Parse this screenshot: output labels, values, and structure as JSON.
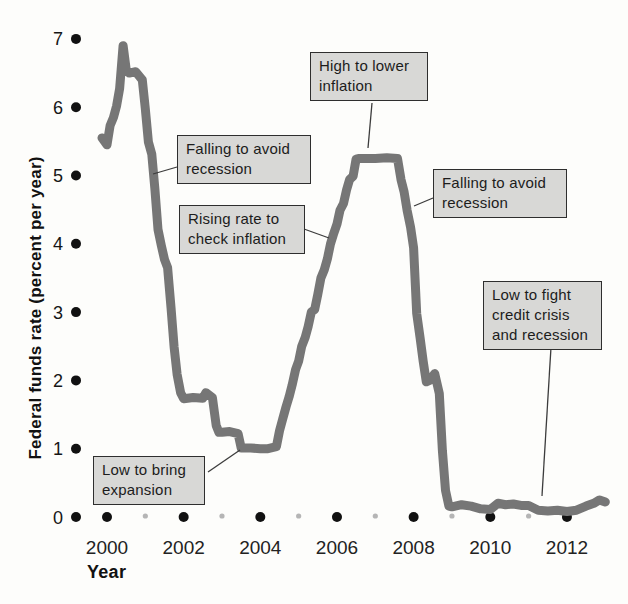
{
  "figure": {
    "y_axis_title": "Federal funds rate (percent per year)",
    "x_axis_title": "Year"
  },
  "annotations": [
    {
      "id": "falling-2001",
      "text": "Falling to avoid recession",
      "lines": [
        "Falling to avoid",
        "recession"
      ],
      "points_to": {
        "year": 2001.2,
        "rate": 5.0
      }
    },
    {
      "id": "rising-2004",
      "text": "Rising rate to check inflation",
      "lines": [
        "Rising rate to",
        "check inflation"
      ],
      "points_to": {
        "year": 2005.8,
        "rate": 4.1
      }
    },
    {
      "id": "high-2006",
      "text": "High to lower inflation",
      "lines": [
        "High to lower",
        "inflation"
      ],
      "points_to": {
        "year": 2006.8,
        "rate": 5.25
      }
    },
    {
      "id": "falling-2008",
      "text": "Falling to avoid recession",
      "lines": [
        "Falling to avoid",
        "recession"
      ],
      "points_to": {
        "year": 2008.0,
        "rate": 4.5
      }
    },
    {
      "id": "low-credit",
      "text": "Low to fight credit crisis and recession",
      "lines": [
        "Low to fight",
        "credit crisis",
        "and recession"
      ],
      "points_to": {
        "year": 2011.3,
        "rate": 0.2
      }
    },
    {
      "id": "low-expansion",
      "text": "Low to bring expansion",
      "lines": [
        "Low to bring",
        "expansion"
      ],
      "points_to": {
        "year": 2003.5,
        "rate": 1.0
      }
    }
  ],
  "chart_data": {
    "type": "line",
    "title": "",
    "xlabel": "Year",
    "ylabel": "Federal funds rate (percent per year)",
    "xlim": [
      1999.2,
      2013.2
    ],
    "ylim": [
      0,
      7
    ],
    "x_ticks_major": [
      2000,
      2002,
      2004,
      2006,
      2008,
      2010,
      2012
    ],
    "x_ticks_minor": [
      2001,
      2003,
      2005,
      2007,
      2009,
      2011
    ],
    "y_ticks": [
      0,
      1,
      2,
      3,
      4,
      5,
      6,
      7
    ],
    "grid": false,
    "legend": "none",
    "series": [
      {
        "name": "Federal funds rate",
        "points": [
          [
            1999.87,
            5.55
          ],
          [
            2000.0,
            5.45
          ],
          [
            2000.08,
            5.73
          ],
          [
            2000.17,
            5.85
          ],
          [
            2000.25,
            6.02
          ],
          [
            2000.33,
            6.27
          ],
          [
            2000.42,
            6.9
          ],
          [
            2000.5,
            6.55
          ],
          [
            2000.58,
            6.5
          ],
          [
            2000.75,
            6.52
          ],
          [
            2000.92,
            6.4
          ],
          [
            2001.0,
            5.98
          ],
          [
            2001.08,
            5.49
          ],
          [
            2001.17,
            5.31
          ],
          [
            2001.25,
            4.8
          ],
          [
            2001.33,
            4.21
          ],
          [
            2001.42,
            3.97
          ],
          [
            2001.5,
            3.77
          ],
          [
            2001.58,
            3.65
          ],
          [
            2001.67,
            3.07
          ],
          [
            2001.75,
            2.49
          ],
          [
            2001.83,
            2.09
          ],
          [
            2001.92,
            1.82
          ],
          [
            2002.0,
            1.73
          ],
          [
            2002.25,
            1.75
          ],
          [
            2002.5,
            1.74
          ],
          [
            2002.58,
            1.82
          ],
          [
            2002.75,
            1.75
          ],
          [
            2002.85,
            1.34
          ],
          [
            2002.92,
            1.24
          ],
          [
            2003.0,
            1.24
          ],
          [
            2003.2,
            1.25
          ],
          [
            2003.42,
            1.22
          ],
          [
            2003.5,
            1.01
          ],
          [
            2003.75,
            1.01
          ],
          [
            2004.0,
            1.0
          ],
          [
            2004.2,
            1.0
          ],
          [
            2004.42,
            1.03
          ],
          [
            2004.5,
            1.26
          ],
          [
            2004.58,
            1.43
          ],
          [
            2004.67,
            1.61
          ],
          [
            2004.75,
            1.76
          ],
          [
            2004.83,
            1.93
          ],
          [
            2004.92,
            2.16
          ],
          [
            2005.0,
            2.28
          ],
          [
            2005.08,
            2.5
          ],
          [
            2005.17,
            2.63
          ],
          [
            2005.25,
            2.79
          ],
          [
            2005.33,
            3.0
          ],
          [
            2005.42,
            3.04
          ],
          [
            2005.5,
            3.26
          ],
          [
            2005.58,
            3.5
          ],
          [
            2005.67,
            3.62
          ],
          [
            2005.75,
            3.78
          ],
          [
            2005.83,
            4.0
          ],
          [
            2005.92,
            4.16
          ],
          [
            2006.0,
            4.29
          ],
          [
            2006.08,
            4.49
          ],
          [
            2006.17,
            4.59
          ],
          [
            2006.25,
            4.79
          ],
          [
            2006.33,
            4.94
          ],
          [
            2006.42,
            4.99
          ],
          [
            2006.5,
            5.24
          ],
          [
            2006.58,
            5.25
          ],
          [
            2007.0,
            5.25
          ],
          [
            2007.3,
            5.26
          ],
          [
            2007.58,
            5.25
          ],
          [
            2007.67,
            4.94
          ],
          [
            2007.75,
            4.76
          ],
          [
            2007.83,
            4.49
          ],
          [
            2007.92,
            4.24
          ],
          [
            2008.0,
            3.94
          ],
          [
            2008.08,
            2.98
          ],
          [
            2008.17,
            2.61
          ],
          [
            2008.25,
            2.28
          ],
          [
            2008.33,
            1.98
          ],
          [
            2008.42,
            2.0
          ],
          [
            2008.55,
            2.1
          ],
          [
            2008.67,
            1.81
          ],
          [
            2008.75,
            0.97
          ],
          [
            2008.83,
            0.39
          ],
          [
            2008.92,
            0.16
          ],
          [
            2009.0,
            0.15
          ],
          [
            2009.25,
            0.18
          ],
          [
            2009.5,
            0.16
          ],
          [
            2009.75,
            0.12
          ],
          [
            2010.0,
            0.11
          ],
          [
            2010.2,
            0.2
          ],
          [
            2010.4,
            0.18
          ],
          [
            2010.6,
            0.19
          ],
          [
            2010.8,
            0.17
          ],
          [
            2011.0,
            0.17
          ],
          [
            2011.25,
            0.1
          ],
          [
            2011.5,
            0.09
          ],
          [
            2011.75,
            0.1
          ],
          [
            2012.0,
            0.08
          ],
          [
            2012.25,
            0.1
          ],
          [
            2012.5,
            0.16
          ],
          [
            2012.7,
            0.2
          ],
          [
            2012.85,
            0.25
          ],
          [
            2013.0,
            0.22
          ]
        ]
      }
    ],
    "colors": {
      "line": "#767676",
      "major_tick_dot": "#111111",
      "minor_tick_dot": "#b5b5b5",
      "annotation_fill": "#d8d8d6",
      "annotation_border": "#2e2e2e",
      "callout_line": "#3c3c3c"
    }
  }
}
